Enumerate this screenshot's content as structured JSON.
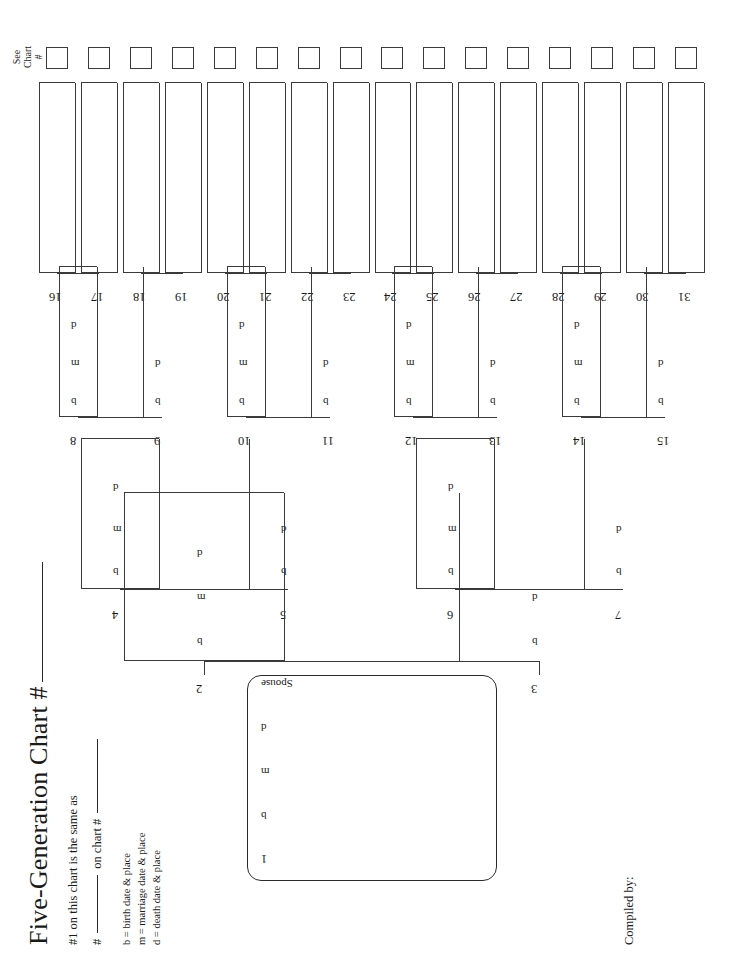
{
  "document": {
    "title": "Five-Generation Chart #",
    "same_as_line": "#1 on this chart is the same as",
    "number_line_prefix": "#",
    "number_line_middle": "on chart #",
    "compiled_by": "Compiled by:",
    "see_chart_line1": "See",
    "see_chart_line2": "Chart",
    "see_chart_line3": "#"
  },
  "legend": {
    "birth": "b = birth date & place",
    "marriage": "m = marriage date & place",
    "death": "d = death date & place"
  },
  "fields": {
    "b": "b",
    "m": "m",
    "d": "d",
    "spouse": "Spouse"
  },
  "subject": {
    "number": "1",
    "b": "b",
    "m": "m",
    "d": "d",
    "spouse": "Spouse"
  },
  "generations": [
    {
      "generation": 2,
      "boxed": true,
      "entries": [
        {
          "number": "2",
          "fields": [
            "b",
            "m",
            "d"
          ]
        },
        {
          "number": "3",
          "fields": [
            "b",
            "d"
          ]
        }
      ]
    },
    {
      "generation": 3,
      "boxed": true,
      "entries": [
        {
          "number": "4",
          "fields": [
            "b",
            "m",
            "d"
          ]
        },
        {
          "number": "5",
          "fields": [
            "b",
            "d"
          ]
        },
        {
          "number": "6",
          "fields": [
            "b",
            "m",
            "d"
          ]
        },
        {
          "number": "7",
          "fields": [
            "b",
            "d"
          ]
        }
      ]
    },
    {
      "generation": 4,
      "boxed": true,
      "entries": [
        {
          "number": "8",
          "fields": [
            "b",
            "m",
            "d"
          ]
        },
        {
          "number": "9",
          "fields": [
            "b",
            "d"
          ]
        },
        {
          "number": "10",
          "fields": [
            "b",
            "m",
            "d"
          ]
        },
        {
          "number": "11",
          "fields": [
            "b",
            "d"
          ]
        },
        {
          "number": "12",
          "fields": [
            "b",
            "m",
            "d"
          ]
        },
        {
          "number": "13",
          "fields": [
            "b",
            "d"
          ]
        },
        {
          "number": "14",
          "fields": [
            "b",
            "m",
            "d"
          ]
        },
        {
          "number": "15",
          "fields": [
            "b",
            "d"
          ]
        }
      ]
    },
    {
      "generation": 5,
      "boxed": true,
      "has_see_chart_square": true,
      "entries": [
        {
          "number": "16"
        },
        {
          "number": "17"
        },
        {
          "number": "18"
        },
        {
          "number": "19"
        },
        {
          "number": "20"
        },
        {
          "number": "21"
        },
        {
          "number": "22"
        },
        {
          "number": "23"
        },
        {
          "number": "24"
        },
        {
          "number": "25"
        },
        {
          "number": "26"
        },
        {
          "number": "27"
        },
        {
          "number": "28"
        },
        {
          "number": "29"
        },
        {
          "number": "30"
        },
        {
          "number": "31"
        }
      ]
    }
  ],
  "colors": {
    "ink": "#3a3a3a",
    "text": "#1a1a1a",
    "paper": "#ffffff"
  }
}
